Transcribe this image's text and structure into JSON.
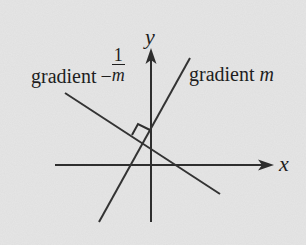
{
  "diagram": {
    "type": "perpendicular-lines-coordinate-axes",
    "background_color": "#e5e5e5",
    "line_color": "#333333",
    "axes": {
      "x_label": "x",
      "y_label": "y"
    },
    "lines": [
      {
        "id": "line-m",
        "label_prefix": "gradient",
        "label_var": "m"
      },
      {
        "id": "line-neg-recip",
        "label_prefix": "gradient",
        "label_sign": "−",
        "label_num": "1",
        "label_den": "m"
      }
    ],
    "annotations": {
      "right_angle_marker": true
    }
  }
}
